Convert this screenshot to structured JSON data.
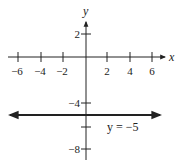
{
  "graph": {
    "x_axis_label": "x",
    "y_axis_label": "y",
    "x_ticks": [
      {
        "value": -6,
        "label": "−6"
      },
      {
        "value": -4,
        "label": "−4"
      },
      {
        "value": -2,
        "label": "−2"
      },
      {
        "value": 2,
        "label": "2"
      },
      {
        "value": 4,
        "label": "4"
      },
      {
        "value": 6,
        "label": "6"
      }
    ],
    "y_ticks": [
      {
        "value": 2,
        "label": "2"
      },
      {
        "value": -4,
        "label": "−4"
      },
      {
        "value": -6,
        "label": ""
      },
      {
        "value": -8,
        "label": "−8"
      }
    ],
    "line_label": "y = −5",
    "line_equation": "y = -5",
    "colors": {
      "axis": "#222222",
      "line": "#222222"
    }
  }
}
